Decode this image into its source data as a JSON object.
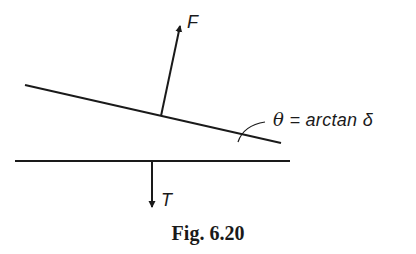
{
  "figure": {
    "caption": "Fig. 6.20",
    "labels": {
      "force": "F",
      "tension": "T",
      "angle_symbol": "θ",
      "angle_equation": " = arctan δ"
    },
    "colors": {
      "ink": "#1a1a1a",
      "background": "#ffffff"
    },
    "elements": {
      "sloped_line": {
        "x1": 25,
        "y1": 85,
        "x2": 281,
        "y2": 143
      },
      "horizontal_line": {
        "x1": 15,
        "y1": 161,
        "x2": 290,
        "y2": 161
      },
      "force_arrow": {
        "from": [
          161,
          116
        ],
        "to": [
          180,
          25
        ]
      },
      "tension_arrow": {
        "from": [
          152,
          161
        ],
        "to": [
          152,
          208
        ]
      }
    }
  }
}
